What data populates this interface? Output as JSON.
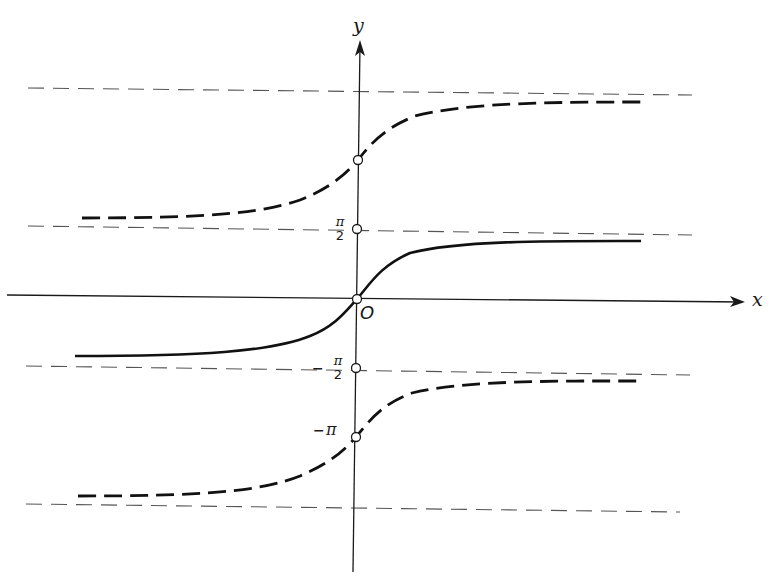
{
  "figure": {
    "axes": {
      "x_label": "x",
      "y_label": "y",
      "origin_label": "O"
    },
    "tick_labels": {
      "pi_over_2": {
        "numerator": "π",
        "denominator": "2"
      },
      "neg_pi_over_2": {
        "sign": "−",
        "numerator": "π",
        "denominator": "2"
      },
      "neg_pi": {
        "sign": "−",
        "symbol": "π"
      }
    },
    "curves": [
      {
        "name": "principal-branch",
        "style": "solid",
        "passes_through": "O",
        "asymptotes": [
          "-π/2",
          "π/2"
        ]
      },
      {
        "name": "upper-branch",
        "style": "dashed",
        "passes_through": "π",
        "asymptotes": [
          "π/2",
          "3π/2"
        ]
      },
      {
        "name": "lower-branch",
        "style": "dashed",
        "passes_through": "-π",
        "asymptotes": [
          "-3π/2",
          "-π/2"
        ]
      }
    ],
    "asymptotes": [
      "3π/2",
      "π/2",
      "-π/2",
      "-3π/2"
    ],
    "marked_points": [
      "π",
      "π/2",
      "O",
      "-π/2",
      "-π"
    ],
    "colors": {
      "ink": "#1a1a1a",
      "asymptote": "#4a4a4a",
      "background": "#ffffff"
    }
  }
}
